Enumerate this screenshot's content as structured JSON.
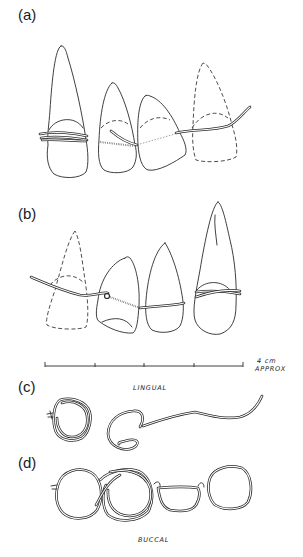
{
  "figure": {
    "panels": [
      {
        "id": "a",
        "label": "(a)",
        "description": "Four teeth (lingual view) joined by wire ligature; rightmost tooth drawn dashed (missing)"
      },
      {
        "id": "b",
        "label": "(b)",
        "description": "Four teeth joined by wire ligature; leftmost tooth drawn dashed (missing)"
      },
      {
        "id": "c",
        "label": "(c)",
        "description": "Wire loops, lingual side"
      },
      {
        "id": "d",
        "label": "(d)",
        "description": "Chain of wire loops, buccal side"
      }
    ],
    "scale_bar": {
      "label_line1": "4 cm",
      "label_line2": "APPROX",
      "ticks": 5
    },
    "annotations": {
      "lingual": "LINGUAL",
      "buccal": "BUCCAL"
    }
  },
  "colors": {
    "line": "#2a2a2a",
    "background": "#ffffff"
  }
}
